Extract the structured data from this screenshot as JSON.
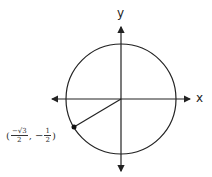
{
  "diagram": {
    "axes": {
      "x_label": "x",
      "y_label": "y"
    },
    "point": {
      "open": "(",
      "x_sign": "−",
      "x_num": "√3",
      "x_den": "2",
      "sep": ", −",
      "y_num": "1",
      "y_den": "2",
      "close": ")"
    },
    "colors": {
      "stroke": "#222222"
    }
  }
}
